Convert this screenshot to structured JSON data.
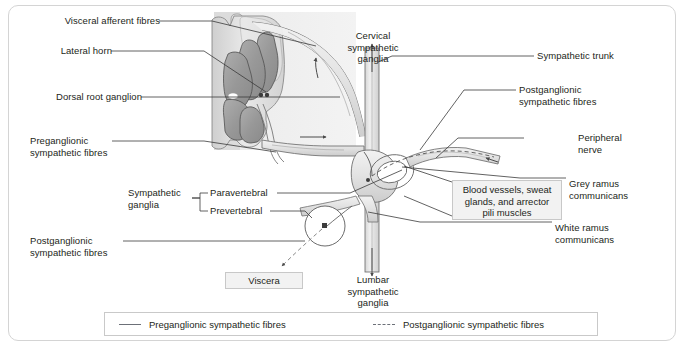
{
  "figure": {
    "type": "anatomical-diagram"
  },
  "labels": {
    "visceral_afferent": "Visceral afferent fibres",
    "lateral_horn": "Lateral horn",
    "dorsal_root_ganglion": "Dorsal root ganglion",
    "preganglionic_left": "Preganglionic\nsympathetic fibres",
    "postganglionic_left": "Postganglionic\nsympathetic fibres",
    "sympathetic_ganglia": "Sympathetic\nganglia",
    "paravertebral": "Paravertebral",
    "prevertebral": "Prevertebral",
    "cervical_ganglia": "Cervical\nsympathetic\nganglia",
    "lumbar_ganglia": "Lumbar\nsympathetic\nganglia",
    "sympathetic_trunk": "Sympathetic trunk",
    "postganglionic_right": "Postganglionic\nsympathetic fibres",
    "peripheral_nerve": "Peripheral\nnerve",
    "grey_ramus": "Grey ramus\ncommunicans",
    "white_ramus": "White ramus\ncommunicans",
    "viscera_box": "Viscera",
    "target_organs_box": "Blood vessels, sweat\nglands, and arrector\npili muscles"
  },
  "legend": {
    "items": [
      {
        "label": "Preganglionic sympathetic fibres",
        "style": "solid",
        "color": "#6c7078"
      },
      {
        "label": "Postganglionic sympathetic fibres",
        "style": "dashed",
        "color": "#6c7078"
      }
    ]
  },
  "colors": {
    "frame_border": "#d4d4d4",
    "text": "#231f20",
    "leader_line": "#3a3a3a",
    "grey_matter": "#9a9a9a",
    "white_matter": "#d9d9d9",
    "nerve_fill": "#e6e6e6",
    "nerve_stroke": "#6e6e6e",
    "box_fill": "#f2f2f2",
    "box_border": "#c8c8c8",
    "backdrop_shade": "#e0e0e0"
  }
}
